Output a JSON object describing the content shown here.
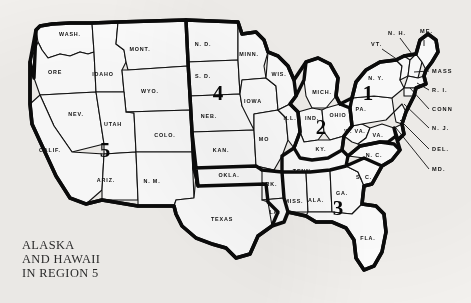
{
  "figure": {
    "caption_lines": [
      "ALASKA",
      "AND HAWAII",
      "IN REGION 5"
    ],
    "caption_text": "ALASKA\nAND HAWAII\nIN REGION 5",
    "background_color": "#f3f1ee",
    "ink_color": "#111111",
    "state_fill": "#ffffff"
  },
  "regions": [
    {
      "number": "1",
      "x": 368,
      "y": 100
    },
    {
      "number": "2",
      "x": 321,
      "y": 134
    },
    {
      "number": "3",
      "x": 338,
      "y": 215
    },
    {
      "number": "4",
      "x": 218,
      "y": 100
    },
    {
      "number": "5",
      "x": 105,
      "y": 157
    }
  ],
  "states": [
    {
      "abbr": "WASH.",
      "x": 70,
      "y": 36
    },
    {
      "abbr": "ORE",
      "x": 55,
      "y": 74
    },
    {
      "abbr": "IDAHO",
      "x": 103,
      "y": 76
    },
    {
      "abbr": "MONT.",
      "x": 140,
      "y": 51
    },
    {
      "abbr": "WYO.",
      "x": 150,
      "y": 93
    },
    {
      "abbr": "NEV.",
      "x": 76,
      "y": 116
    },
    {
      "abbr": "UTAH",
      "x": 113,
      "y": 126
    },
    {
      "abbr": "CALIF.",
      "x": 50,
      "y": 152
    },
    {
      "abbr": "ARIZ.",
      "x": 106,
      "y": 182
    },
    {
      "abbr": "COLO.",
      "x": 165,
      "y": 137
    },
    {
      "abbr": "N. M.",
      "x": 152,
      "y": 183
    },
    {
      "abbr": "N. D.",
      "x": 203,
      "y": 46
    },
    {
      "abbr": "S. D.",
      "x": 203,
      "y": 78
    },
    {
      "abbr": "NEB.",
      "x": 209,
      "y": 118
    },
    {
      "abbr": "KAN.",
      "x": 221,
      "y": 152
    },
    {
      "abbr": "OKLA.",
      "x": 229,
      "y": 177
    },
    {
      "abbr": "TEXAS",
      "x": 222,
      "y": 221
    },
    {
      "abbr": "MINN.",
      "x": 249,
      "y": 56
    },
    {
      "abbr": "IOWA",
      "x": 253,
      "y": 103
    },
    {
      "abbr": "MO",
      "x": 264,
      "y": 141
    },
    {
      "abbr": "ARK.",
      "x": 269,
      "y": 186
    },
    {
      "abbr": "LA.",
      "x": 275,
      "y": 214
    },
    {
      "abbr": "WIS.",
      "x": 279,
      "y": 76
    },
    {
      "abbr": "ILL.",
      "x": 290,
      "y": 120
    },
    {
      "abbr": "MICH.",
      "x": 322,
      "y": 94
    },
    {
      "abbr": "IND.",
      "x": 312,
      "y": 120
    },
    {
      "abbr": "OHIO",
      "x": 338,
      "y": 117
    },
    {
      "abbr": "KY.",
      "x": 321,
      "y": 151
    },
    {
      "abbr": "TENN.",
      "x": 303,
      "y": 173
    },
    {
      "abbr": "MISS.",
      "x": 294,
      "y": 203
    },
    {
      "abbr": "ALA.",
      "x": 316,
      "y": 202
    },
    {
      "abbr": "GA.",
      "x": 342,
      "y": 195
    },
    {
      "abbr": "FLA.",
      "x": 368,
      "y": 240
    },
    {
      "abbr": "S. C.",
      "x": 364,
      "y": 179
    },
    {
      "abbr": "N. C.",
      "x": 374,
      "y": 157
    },
    {
      "abbr": "W. VA.",
      "x": 355,
      "y": 133
    },
    {
      "abbr": "VA.",
      "x": 378,
      "y": 137
    },
    {
      "abbr": "PA.",
      "x": 361,
      "y": 111
    },
    {
      "abbr": "N. Y.",
      "x": 376,
      "y": 80
    }
  ],
  "callouts": [
    {
      "label": "N. H.",
      "lx": 388,
      "ly": 35,
      "x1": 400,
      "y1": 38,
      "x2": 412,
      "y2": 54
    },
    {
      "label": "VT.",
      "lx": 371,
      "ly": 46,
      "x1": 382,
      "y1": 49,
      "x2": 398,
      "y2": 60
    },
    {
      "label": "ME.",
      "lx": 420,
      "ly": 33,
      "x1": 424,
      "y1": 40,
      "x2": 424,
      "y2": 46
    },
    {
      "label": "MASS",
      "lx": 432,
      "ly": 73,
      "x1": 429,
      "y1": 71,
      "x2": 414,
      "y2": 72
    },
    {
      "label": "R. I.",
      "lx": 432,
      "ly": 92,
      "x1": 429,
      "y1": 90,
      "x2": 417,
      "y2": 83
    },
    {
      "label": "CONN",
      "lx": 432,
      "ly": 111,
      "x1": 429,
      "y1": 109,
      "x2": 410,
      "y2": 88
    },
    {
      "label": "N. J.",
      "lx": 432,
      "ly": 130,
      "x1": 429,
      "y1": 128,
      "x2": 404,
      "y2": 104
    },
    {
      "label": "DEL.",
      "lx": 432,
      "ly": 151,
      "x1": 429,
      "y1": 149,
      "x2": 400,
      "y2": 120
    },
    {
      "label": "MD.",
      "lx": 432,
      "ly": 171,
      "x1": 429,
      "y1": 169,
      "x2": 396,
      "y2": 128
    }
  ]
}
